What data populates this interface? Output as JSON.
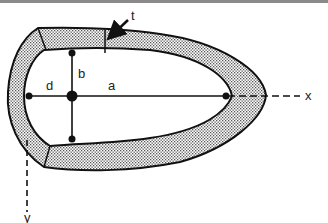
{
  "diagram": {
    "labels": {
      "thickness": "t",
      "semi_minor": "b",
      "offset": "d",
      "semi_major": "a",
      "x_axis": "x",
      "y_axis": "y"
    },
    "colors": {
      "stroke": "#111111",
      "fill_pattern": "#555555",
      "background": "#ffffff",
      "top_border": "#8a8a8a"
    }
  }
}
